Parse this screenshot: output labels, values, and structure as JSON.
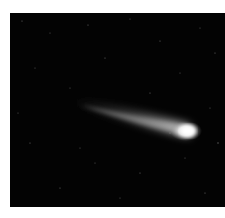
{
  "image": {
    "subject": "comet",
    "description": "Comet with bright nucleus and long diffuse tail against a dark starry sky",
    "background_color": "#030303",
    "nucleus_color": "#ffffff",
    "tail_color": "#bfbfbf"
  },
  "caption": {
    "text": ""
  }
}
